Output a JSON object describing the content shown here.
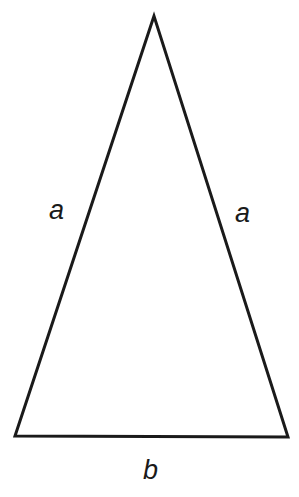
{
  "diagram": {
    "type": "isosceles-triangle",
    "vertices": {
      "apex": [
        154,
        16
      ],
      "bottom_left": [
        15,
        436
      ],
      "bottom_right": [
        288,
        437
      ]
    },
    "stroke_color": "#1a1a1a",
    "labels": {
      "left_side": "a",
      "right_side": "a",
      "base": "b"
    }
  }
}
